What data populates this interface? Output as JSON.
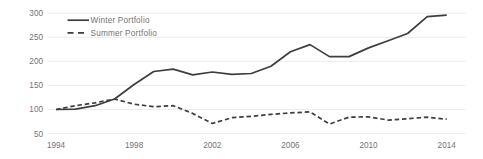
{
  "chart_data": {
    "type": "line",
    "title": "",
    "xlabel": "",
    "ylabel": "",
    "x": [
      1994,
      1995,
      1996,
      1997,
      1998,
      1999,
      2000,
      2001,
      2002,
      2003,
      2004,
      2005,
      2006,
      2007,
      2008,
      2009,
      2010,
      2011,
      2012,
      2013,
      2014
    ],
    "series": [
      {
        "name": "Winter Portfolio",
        "line_style": "solid",
        "values": [
          100,
          101,
          108,
          122,
          152,
          179,
          184,
          172,
          178,
          173,
          175,
          190,
          220,
          235,
          210,
          210,
          228,
          243,
          258,
          293,
          296
        ]
      },
      {
        "name": "Summer Portfolio",
        "line_style": "dashed",
        "values": [
          100,
          108,
          114,
          122,
          111,
          106,
          108,
          92,
          71,
          83,
          86,
          90,
          93,
          95,
          70,
          84,
          85,
          78,
          81,
          84,
          80
        ]
      }
    ],
    "x_ticks": [
      1994,
      1998,
      2002,
      2006,
      2010,
      2014
    ],
    "y_ticks": [
      50,
      100,
      150,
      200,
      250,
      300
    ],
    "ylim": [
      50,
      300
    ],
    "grid": "horizontal-only",
    "legend_position": "top-left-inside",
    "colors": {
      "line": "#3e3e3e",
      "grid": "#eaeae8",
      "tick_label": "#78726e",
      "background": "#ffffff"
    }
  }
}
